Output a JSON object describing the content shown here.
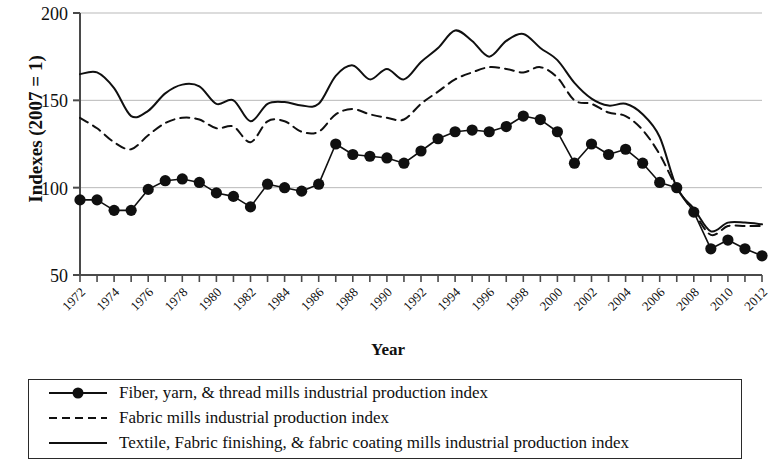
{
  "chart_data": {
    "type": "line",
    "title": "",
    "xlabel": "Year",
    "ylabel": "Indexes (2007 = 1)",
    "xlim": [
      1972,
      2012
    ],
    "ylim": [
      50,
      200
    ],
    "yticks": [
      50,
      100,
      150,
      200
    ],
    "xticks": [
      1972,
      1974,
      1976,
      1978,
      1980,
      1982,
      1984,
      1986,
      1988,
      1990,
      1992,
      1994,
      1996,
      1998,
      2000,
      2002,
      2004,
      2006,
      2008,
      2010,
      2012
    ],
    "grid": "horizontal",
    "legend_position": "below",
    "x": [
      1972,
      1973,
      1974,
      1975,
      1976,
      1977,
      1978,
      1979,
      1980,
      1981,
      1982,
      1983,
      1984,
      1985,
      1986,
      1987,
      1988,
      1989,
      1990,
      1991,
      1992,
      1993,
      1994,
      1995,
      1996,
      1997,
      1998,
      1999,
      2000,
      2001,
      2002,
      2003,
      2004,
      2005,
      2006,
      2007,
      2008,
      2009,
      2010,
      2011,
      2012
    ],
    "series": [
      {
        "name": "Fiber, yarn, & thread mills industrial production index",
        "style": "solid-marker",
        "marker": "filled-circle",
        "color": "#101010",
        "values": [
          93,
          93,
          87,
          87,
          99,
          104,
          105,
          103,
          97,
          95,
          89,
          102,
          100,
          98,
          102,
          125,
          119,
          118,
          117,
          114,
          121,
          128,
          132,
          133,
          132,
          135,
          141,
          139,
          132,
          114,
          125,
          119,
          122,
          114,
          103,
          100,
          86,
          65,
          70,
          65,
          61
        ]
      },
      {
        "name": "Fabric mills industrial production index",
        "style": "dashed",
        "color": "#101010",
        "values": [
          140,
          134,
          126,
          122,
          130,
          137,
          140,
          139,
          134,
          135,
          126,
          138,
          138,
          132,
          132,
          142,
          145,
          142,
          140,
          139,
          148,
          155,
          162,
          166,
          169,
          168,
          166,
          169,
          163,
          150,
          148,
          143,
          141,
          133,
          119,
          100,
          86,
          73,
          78,
          78,
          78
        ]
      },
      {
        "name": "Textile, Fabric finishing, & fabric coating mills industrial production index",
        "style": "solid",
        "color": "#101010",
        "values": [
          165,
          166,
          157,
          141,
          144,
          154,
          159,
          158,
          148,
          150,
          138,
          148,
          149,
          147,
          148,
          164,
          170,
          162,
          168,
          162,
          172,
          180,
          190,
          184,
          175,
          184,
          188,
          180,
          173,
          160,
          151,
          147,
          148,
          142,
          129,
          100,
          88,
          75,
          80,
          80,
          79
        ]
      }
    ]
  },
  "legend": {
    "items": [
      {
        "label": "Fiber, yarn, & thread mills industrial production index",
        "sample": "line-with-dot-marker"
      },
      {
        "label": "Fabric mills industrial production index",
        "sample": "dashed-line"
      },
      {
        "label": "Textile, Fabric finishing, & fabric coating mills industrial production index",
        "sample": "solid-line"
      }
    ]
  }
}
